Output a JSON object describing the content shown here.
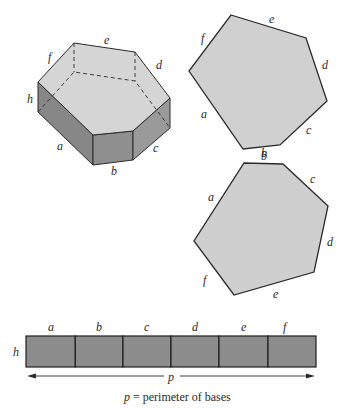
{
  "figure": {
    "colors": {
      "top_face": "#d4d4d4",
      "side_face_dark": "#8a8a8a",
      "side_face_mid": "#9c9c9c",
      "base_polygon": "#d0d0d0",
      "lateral_net": "#8c8c8c",
      "stroke": "#2b2b2b"
    },
    "prism": {
      "edge_labels": {
        "a": "a",
        "b": "b",
        "c": "c",
        "d": "d",
        "e": "e",
        "f": "f",
        "h": "h"
      }
    },
    "top_base": {
      "edge_labels": {
        "a": "a",
        "b": "b",
        "c": "c",
        "d": "d",
        "e": "e",
        "f": "f"
      }
    },
    "bottom_base": {
      "edge_labels": {
        "a": "a",
        "b": "b",
        "c": "c",
        "d": "d",
        "e": "e",
        "f": "f"
      }
    },
    "lateral_net": {
      "column_labels": [
        "a",
        "b",
        "c",
        "d",
        "e",
        "f"
      ],
      "height_label": "h",
      "perimeter_label": "p"
    },
    "caption": {
      "var": "p",
      "text": " = perimeter of bases"
    }
  }
}
